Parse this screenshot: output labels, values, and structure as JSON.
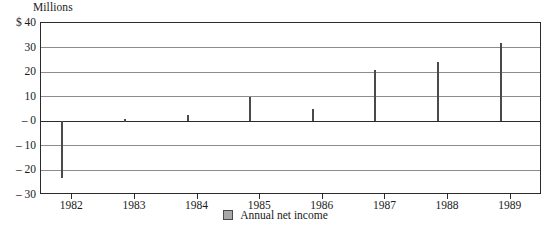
{
  "chart_data": {
    "type": "bar",
    "title": "",
    "subtitle": "",
    "units_label": "Millions",
    "xlabel": "",
    "ylabel": "",
    "categories": [
      "1982",
      "1983",
      "1984",
      "1985",
      "1986",
      "1987",
      "1988",
      "1989"
    ],
    "values": [
      -23,
      1,
      2.5,
      10,
      5,
      21,
      24,
      32
    ],
    "series": [
      {
        "name": "Annual net income",
        "values": [
          -23,
          1,
          2.5,
          10,
          5,
          21,
          24,
          32
        ]
      }
    ],
    "ylim": [
      -30,
      40
    ],
    "yticks": [
      40,
      30,
      20,
      10,
      0,
      -10,
      -20,
      -30
    ],
    "ytick_labels": [
      "$ 40",
      "30",
      "20",
      "10",
      "– 0",
      "– 10",
      "– 20",
      "– 30"
    ],
    "grid": true,
    "legend": {
      "position": "bottom-center",
      "entries": [
        {
          "label": "Annual net income",
          "color": "#a8a8a8"
        }
      ]
    },
    "colors": {
      "bar_fill": "#a8a8a8",
      "bar_stroke": "#4a4a4a",
      "grid": "#8d8d8d",
      "axis": "#2b2b2b",
      "background": "#ffffff",
      "text": "#1a1a1a"
    }
  }
}
